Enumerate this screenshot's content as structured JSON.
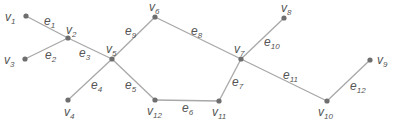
{
  "diagram": {
    "type": "graph",
    "colors": {
      "edge": "#a8a8a8",
      "node": "#6e6e6e",
      "label": "#555555",
      "background": "#ffffff"
    },
    "nodes": [
      {
        "id": "v1",
        "base": "v",
        "sub": "1",
        "x": 26,
        "y": 16,
        "lx": 5,
        "ly": 21
      },
      {
        "id": "v2",
        "base": "v",
        "sub": "2",
        "x": 68,
        "y": 38,
        "lx": 66,
        "ly": 34
      },
      {
        "id": "v3",
        "base": "v",
        "sub": "3",
        "x": 25,
        "y": 59,
        "lx": 4,
        "ly": 64
      },
      {
        "id": "v4",
        "base": "v",
        "sub": "4",
        "x": 68,
        "y": 100,
        "lx": 64,
        "ly": 116
      },
      {
        "id": "v5",
        "base": "v",
        "sub": "5",
        "x": 112,
        "y": 59,
        "lx": 106,
        "ly": 53
      },
      {
        "id": "v6",
        "base": "v",
        "sub": "6",
        "x": 155,
        "y": 17,
        "lx": 149,
        "ly": 11
      },
      {
        "id": "v7",
        "base": "v",
        "sub": "7",
        "x": 241,
        "y": 59,
        "lx": 234,
        "ly": 53
      },
      {
        "id": "v8",
        "base": "v",
        "sub": "8",
        "x": 284,
        "y": 18,
        "lx": 281,
        "ly": 12
      },
      {
        "id": "v9",
        "base": "v",
        "sub": "9",
        "x": 370,
        "y": 60,
        "lx": 377,
        "ly": 64
      },
      {
        "id": "v10",
        "base": "v",
        "sub": "10",
        "x": 327,
        "y": 101,
        "lx": 318,
        "ly": 116
      },
      {
        "id": "v11",
        "base": "v",
        "sub": "11",
        "x": 219,
        "y": 101,
        "lx": 212,
        "ly": 116
      },
      {
        "id": "v12",
        "base": "v",
        "sub": "12",
        "x": 155,
        "y": 100,
        "lx": 147,
        "ly": 115
      }
    ],
    "edges": [
      {
        "id": "e1",
        "from": "v1",
        "to": "v2",
        "base": "e",
        "sub": "1",
        "lx": 44,
        "ly": 25
      },
      {
        "id": "e2",
        "from": "v3",
        "to": "v2",
        "base": "e",
        "sub": "2",
        "lx": 45,
        "ly": 59
      },
      {
        "id": "e3",
        "from": "v2",
        "to": "v5",
        "base": "e",
        "sub": "3",
        "lx": 79,
        "ly": 57
      },
      {
        "id": "e4",
        "from": "v5",
        "to": "v4",
        "base": "e",
        "sub": "4",
        "lx": 91,
        "ly": 89
      },
      {
        "id": "e5",
        "from": "v5",
        "to": "v12",
        "base": "e",
        "sub": "5",
        "lx": 125,
        "ly": 89
      },
      {
        "id": "e6",
        "from": "v12",
        "to": "v11",
        "base": "e",
        "sub": "6",
        "lx": 182,
        "ly": 112
      },
      {
        "id": "e7",
        "from": "v11",
        "to": "v7",
        "base": "e",
        "sub": "7",
        "lx": 232,
        "ly": 86
      },
      {
        "id": "e8",
        "from": "v6",
        "to": "v7",
        "base": "e",
        "sub": "8",
        "lx": 191,
        "ly": 35
      },
      {
        "id": "e9",
        "from": "v5",
        "to": "v6",
        "base": "e",
        "sub": "9",
        "lx": 125,
        "ly": 35
      },
      {
        "id": "e10",
        "from": "v7",
        "to": "v8",
        "base": "e",
        "sub": "10",
        "lx": 264,
        "ly": 46
      },
      {
        "id": "e11",
        "from": "v7",
        "to": "v10",
        "base": "e",
        "sub": "11",
        "lx": 283,
        "ly": 79
      },
      {
        "id": "e12",
        "from": "v10",
        "to": "v9",
        "base": "e",
        "sub": "12",
        "lx": 350,
        "ly": 90
      }
    ]
  }
}
